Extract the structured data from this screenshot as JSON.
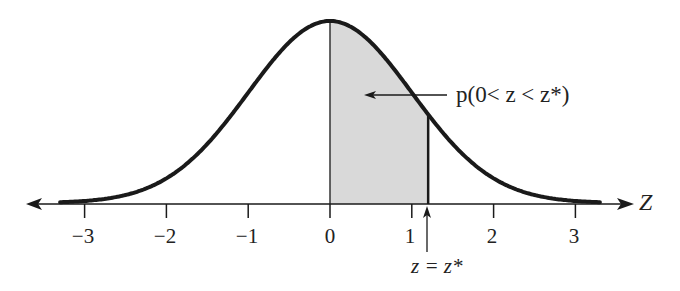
{
  "figure": {
    "type": "standard normal distribution diagram",
    "axis_name": "Z",
    "tick_labels": [
      "−3",
      "−2",
      "−1",
      "0",
      "1",
      "2",
      "3"
    ],
    "tick_values": [
      -3,
      -2,
      -1,
      0,
      1,
      2,
      3
    ],
    "shaded_region": {
      "from": 0,
      "to": 1.2,
      "color": "#d9d9d9"
    },
    "region_label": "p(0< z < z*)",
    "marker_label": "z = z*",
    "curve_color": "#1a1a1a",
    "axis_color": "#1a1a1a"
  },
  "chart_data": {
    "type": "area",
    "title": "",
    "xlabel": "Z",
    "ylabel": "",
    "x_ticks": [
      -3,
      -2,
      -1,
      0,
      1,
      2,
      3
    ],
    "xlim": [
      -3.7,
      3.7
    ],
    "series": [
      {
        "name": "standard normal density",
        "function": "N(0,1)",
        "x_range": [
          -3.3,
          3.3
        ]
      }
    ],
    "shaded_interval": [
      0,
      1.2
    ],
    "annotations": [
      {
        "text": "p(0< z < z*)",
        "points_to": "shaded region"
      },
      {
        "text": "z = z*",
        "points_to": "x = z* (~1.2)"
      }
    ],
    "grid": false,
    "legend": "none"
  }
}
